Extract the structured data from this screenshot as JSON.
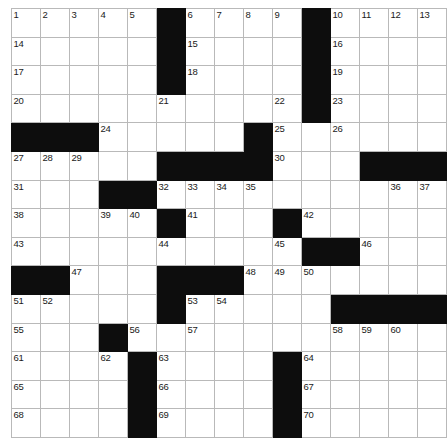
{
  "puzzle": {
    "type": "crossword-grid",
    "rows": 15,
    "cols": 15,
    "cell_color": "#ffffff",
    "block_color": "#0d0d0d",
    "grid_line_color": "#b9b9b9",
    "number_color": "#1a1a1a",
    "max_number": 70,
    "footer_note": "",
    "layout": [
      [
        "1",
        "2",
        "3",
        "4",
        "5",
        "#",
        "6",
        "7",
        "8",
        "9",
        "#",
        "10",
        "11",
        "12",
        "13"
      ],
      [
        "14",
        "",
        "",
        "",
        "",
        "#",
        "15",
        "",
        "",
        "",
        "#",
        "16",
        "",
        "",
        ""
      ],
      [
        "17",
        "",
        "",
        "",
        "",
        "#",
        "18",
        "",
        "",
        "",
        "#",
        "19",
        "",
        "",
        ""
      ],
      [
        "20",
        "",
        "",
        "",
        "",
        "21",
        "",
        "",
        "",
        "22",
        "#",
        "23",
        "",
        "",
        ""
      ],
      [
        "#",
        "#",
        "#",
        "24",
        "",
        "",
        "",
        "",
        "#",
        "25",
        "",
        "26",
        "",
        "",
        ""
      ],
      [
        "27",
        "28",
        "29",
        "",
        "",
        "#",
        "#",
        "#",
        "#",
        "30",
        "",
        "",
        "#",
        "#",
        "#"
      ],
      [
        "31",
        "",
        "",
        "#",
        "#",
        "32",
        "33",
        "34",
        "35",
        "",
        "",
        "",
        "",
        "36",
        "37"
      ],
      [
        "38",
        "",
        "",
        "39",
        "40",
        "#",
        "41",
        "",
        "",
        "#",
        "42",
        "",
        "",
        "",
        ""
      ],
      [
        "43",
        "",
        "",
        "",
        "",
        "44",
        "",
        "",
        "",
        "45",
        "#",
        "#",
        "46",
        "",
        ""
      ],
      [
        "#",
        "#",
        "47",
        "",
        "",
        "#",
        "#",
        "#",
        "48",
        "49",
        "50",
        "",
        "",
        "",
        ""
      ],
      [
        "51",
        "52",
        "",
        "",
        "",
        "#",
        "53",
        "54",
        "",
        "",
        "",
        "#",
        "#",
        "#",
        "#"
      ],
      [
        "55",
        "",
        "",
        "#",
        "56",
        "",
        "57",
        "",
        "",
        "",
        "",
        "58",
        "59",
        "60",
        ""
      ],
      [
        "61",
        "",
        "",
        "62",
        "#",
        "63",
        "",
        "",
        "",
        "#",
        "64",
        "",
        "",
        "",
        ""
      ],
      [
        "65",
        "",
        "",
        "",
        "#",
        "66",
        "",
        "",
        "",
        "#",
        "67",
        "",
        "",
        "",
        ""
      ],
      [
        "68",
        "",
        "",
        "",
        "#",
        "69",
        "",
        "",
        "",
        "#",
        "70",
        "",
        "",
        "",
        ""
      ]
    ]
  }
}
